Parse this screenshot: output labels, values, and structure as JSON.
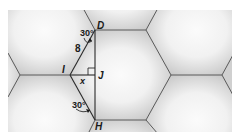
{
  "figure": {
    "background_color": "#d4d4d4",
    "hex_fill_highlight": "#f4f4f4",
    "line_color": "#555555",
    "points": {
      "D": "D",
      "I": "I",
      "J": "J",
      "H": "H"
    },
    "labels": {
      "angle_top": "30°",
      "angle_bottom": "30°",
      "side_length": "8",
      "unknown": "x"
    }
  }
}
